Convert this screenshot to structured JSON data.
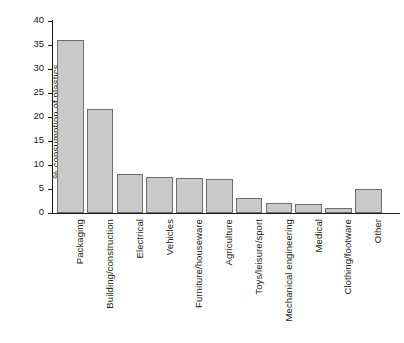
{
  "chart_data": {
    "type": "bar",
    "title": "",
    "subtitle": "",
    "xlabel": "",
    "ylabel": "% consumption of plastics",
    "ylim": [
      0,
      40
    ],
    "yticks": [
      0,
      5,
      10,
      15,
      20,
      25,
      30,
      35,
      40
    ],
    "ytick_labels": [
      "0",
      "5",
      "10",
      "15",
      "20",
      "25",
      "30",
      "35",
      "40"
    ],
    "grid": false,
    "legend": null,
    "bar_color": "#c9c9c9",
    "bar_edge_color": "#6e6e6e",
    "axis_color": "#1a1a1a",
    "categories": [
      "Packaging",
      "Building/construction",
      "Electrical",
      "Vehicles",
      "Furniture/houseware",
      "Agriculture",
      "Toys/leisure/sport",
      "Mechanical engineering",
      "Medical",
      "Clothing/footware",
      "Other"
    ],
    "values": [
      36,
      21.7,
      8.2,
      7.4,
      7.2,
      7.0,
      3.1,
      2.1,
      1.9,
      1.1,
      5.1
    ]
  }
}
